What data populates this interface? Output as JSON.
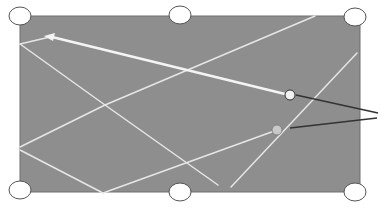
{
  "diagram": {
    "type": "billiard-table-shot-paths",
    "colors": {
      "table": "#8e8e8e",
      "table_border": "#6e6e6e",
      "path": "#e6e6e6",
      "cue_path": "#f4f4f4",
      "pocket_fill": "#ffffff",
      "pocket_stroke": "#555555",
      "pointer": "#333333",
      "ball_white": "#f2f2f2",
      "ball_gray": "#c8c8c8"
    },
    "table": {
      "x": 20,
      "y": 16,
      "width": 340,
      "height": 176
    },
    "pockets": [
      {
        "name": "top-left",
        "cx": 20,
        "cy": 16
      },
      {
        "name": "top-middle",
        "cx": 180,
        "cy": 15
      },
      {
        "name": "top-right",
        "cx": 355,
        "cy": 17
      },
      {
        "name": "bottom-left",
        "cx": 20,
        "cy": 190
      },
      {
        "name": "bottom-middle",
        "cx": 180,
        "cy": 192
      },
      {
        "name": "bottom-right",
        "cx": 355,
        "cy": 192
      }
    ],
    "balls": [
      {
        "name": "cue-ball",
        "cx": 290,
        "cy": 95,
        "color": "white"
      },
      {
        "name": "object-ball",
        "cx": 277,
        "cy": 130,
        "color": "gray"
      }
    ],
    "pointer_lines": [
      {
        "from": [
          296,
          95
        ],
        "to": [
          378,
          113
        ]
      },
      {
        "from": [
          290,
          128
        ],
        "to": [
          377,
          118
        ]
      }
    ],
    "paths": [
      {
        "name": "cue-shot",
        "points": [
          [
            285,
            94
          ],
          [
            50,
            37
          ]
        ],
        "arrow": true
      },
      {
        "name": "path-a",
        "points": [
          [
            50,
            37
          ],
          [
            20,
            44
          ]
        ]
      },
      {
        "name": "path-b",
        "points": [
          [
            20,
            44
          ],
          [
            105,
            105
          ],
          [
            218,
            185
          ]
        ]
      },
      {
        "name": "path-c",
        "points": [
          [
            105,
            105
          ],
          [
            315,
            16
          ]
        ]
      },
      {
        "name": "path-d",
        "points": [
          [
            20,
            147
          ],
          [
            105,
            105
          ]
        ]
      },
      {
        "name": "path-e",
        "points": [
          [
            20,
            150
          ],
          [
            103,
            193
          ]
        ]
      },
      {
        "name": "path-f",
        "points": [
          [
            103,
            193
          ],
          [
            277,
            130
          ]
        ]
      },
      {
        "name": "path-g",
        "points": [
          [
            357,
            53
          ],
          [
            231,
            187
          ]
        ]
      }
    ]
  }
}
